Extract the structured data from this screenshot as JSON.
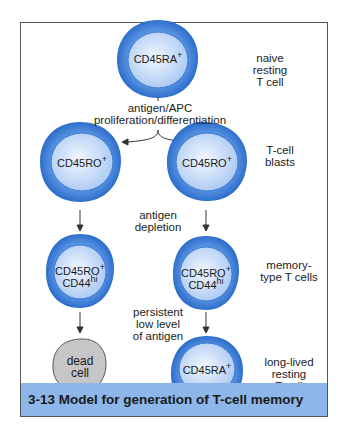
{
  "figure": {
    "caption": "3-13  Model for generation of T-cell memory",
    "colors": {
      "cell_outer": "#3d7fd6",
      "cell_inner": "#d8e8fb",
      "dead_cell": "#c4c4c4",
      "caption_bg": "#8db6ea",
      "arrow": "#333333"
    },
    "cells": [
      {
        "id": "naive",
        "marker": "CD45RA",
        "sup": "+",
        "line2": "",
        "line2_sup": ""
      },
      {
        "id": "blast-left",
        "marker": "CD45RO",
        "sup": "+",
        "line2": "",
        "line2_sup": ""
      },
      {
        "id": "blast-right",
        "marker": "CD45RO",
        "sup": "+",
        "line2": "",
        "line2_sup": ""
      },
      {
        "id": "memory-left",
        "marker": "CD45RO",
        "sup": "+",
        "line2": "CD44",
        "line2_sup": "hi"
      },
      {
        "id": "memory-right",
        "marker": "CD45RO",
        "sup": "+",
        "line2": "CD44",
        "line2_sup": "hi"
      },
      {
        "id": "dead",
        "marker": "dead",
        "sup": "",
        "line2": "cell",
        "line2_sup": ""
      },
      {
        "id": "long-lived",
        "marker": "CD45RA",
        "sup": "+",
        "line2": "",
        "line2_sup": ""
      }
    ],
    "stage_labels": {
      "naive": [
        "naive",
        "resting",
        "T cell"
      ],
      "blasts": [
        "T-cell",
        "blasts"
      ],
      "memory": [
        "memory-",
        "type T cells"
      ],
      "long_lived": [
        "long-lived",
        "resting",
        "T cell"
      ]
    },
    "process_labels": {
      "activation": [
        "antigen/APC",
        "proliferation/differentiation"
      ],
      "depletion": [
        "antigen",
        "depletion"
      ],
      "persistent": [
        "persistent",
        "low level",
        "of antigen"
      ]
    }
  }
}
